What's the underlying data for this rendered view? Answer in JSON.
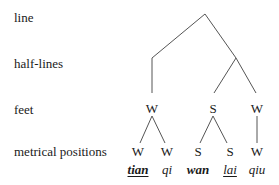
{
  "labels": {
    "line": "line",
    "half_lines": "half-lines",
    "feet": "feet",
    "metrical_positions": "metrical positions"
  },
  "feet": [
    {
      "label": "W",
      "x": 152
    },
    {
      "label": "S",
      "x": 213
    },
    {
      "label": "W",
      "x": 257
    }
  ],
  "positions": [
    {
      "label": "W",
      "x": 138
    },
    {
      "label": "W",
      "x": 167
    },
    {
      "label": "S",
      "x": 198
    },
    {
      "label": "S",
      "x": 230
    },
    {
      "label": "W",
      "x": 257
    }
  ],
  "syllables": [
    {
      "text": "tian",
      "bold": true,
      "underline": true
    },
    {
      "text": "qi",
      "bold": false,
      "underline": false
    },
    {
      "text": "wan",
      "bold": true,
      "underline": false
    },
    {
      "text": "lai",
      "bold": false,
      "underline": true
    },
    {
      "text": "qiu",
      "bold": false,
      "underline": false
    }
  ],
  "colors": {
    "line": "#555555",
    "text": "#1a1a1a"
  }
}
